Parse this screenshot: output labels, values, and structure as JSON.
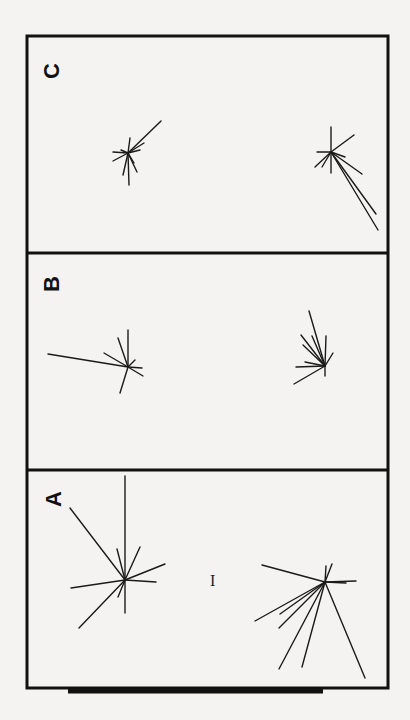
{
  "figure": {
    "frame": {
      "x": 27,
      "y": 36,
      "width": 361,
      "height": 652,
      "stroke": "#111111",
      "stroke_width": 3
    },
    "dividers": [
      253,
      470
    ],
    "bottom_bar": {
      "x1": 68,
      "x2": 323,
      "y": 691,
      "thickness": 5
    },
    "line_color": "#1a1a1a",
    "scale_marker": {
      "label": "I",
      "x": 210,
      "y": 573
    },
    "panels": [
      {
        "label": "C",
        "label_pos": {
          "x": 42,
          "y": 60
        },
        "rosettes": [
          {
            "center": [
              128,
              153
            ],
            "ends": [
              [
                161,
                121
              ],
              [
                130,
                138
              ],
              [
                144,
                143
              ],
              [
                113,
                152
              ],
              [
                113,
                161
              ],
              [
                129,
                185
              ],
              [
                123,
                175
              ],
              [
                137,
                172
              ],
              [
                134,
                163
              ],
              [
                140,
                150
              ],
              [
                121,
                150
              ]
            ]
          },
          {
            "center": [
              331,
              152
            ],
            "ends": [
              [
                331,
                127
              ],
              [
                354,
                135
              ],
              [
                317,
                152
              ],
              [
                315,
                167
              ],
              [
                322,
                167
              ],
              [
                362,
                174
              ],
              [
                376,
                214
              ],
              [
                378,
                230
              ],
              [
                331,
                173
              ],
              [
                345,
                157
              ]
            ]
          }
        ]
      },
      {
        "label": "B",
        "label_pos": {
          "x": 42,
          "y": 273
        },
        "rosettes": [
          {
            "center": [
              128,
              367
            ],
            "ends": [
              [
                128,
                330
              ],
              [
                118,
                338
              ],
              [
                104,
                353
              ],
              [
                48,
                354
              ],
              [
                142,
                368
              ],
              [
                143,
                376
              ],
              [
                120,
                393
              ],
              [
                135,
                360
              ]
            ]
          },
          {
            "center": [
              325,
              366
            ],
            "ends": [
              [
                309,
                311
              ],
              [
                301,
                335
              ],
              [
                303,
                345
              ],
              [
                312,
                336
              ],
              [
                326,
                336
              ],
              [
                333,
                353
              ],
              [
                296,
                367
              ],
              [
                294,
                384
              ],
              [
                305,
                362
              ],
              [
                325,
                376
              ]
            ]
          }
        ]
      },
      {
        "label": "A",
        "label_pos": {
          "x": 44,
          "y": 488
        },
        "rosettes": [
          {
            "center": [
              125,
              580
            ],
            "ends": [
              [
                125,
                476
              ],
              [
                70,
                508
              ],
              [
                117,
                549
              ],
              [
                140,
                547
              ],
              [
                165,
                564
              ],
              [
                156,
                582
              ],
              [
                71,
                588
              ],
              [
                79,
                628
              ],
              [
                118,
                597
              ],
              [
                125,
                613
              ]
            ]
          },
          {
            "center": [
              325,
              582
            ],
            "ends": [
              [
                262,
                565
              ],
              [
                326,
                566
              ],
              [
                332,
                564
              ],
              [
                356,
                581
              ],
              [
                346,
                583
              ],
              [
                255,
                621
              ],
              [
                280,
                614
              ],
              [
                279,
                628
              ],
              [
                279,
                669
              ],
              [
                302,
                667
              ],
              [
                365,
                678
              ]
            ]
          }
        ]
      }
    ]
  }
}
